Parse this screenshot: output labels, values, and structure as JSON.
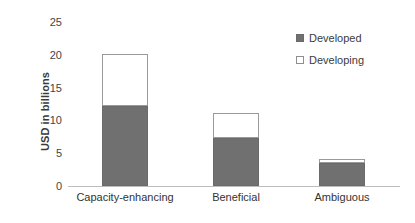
{
  "chart_data": {
    "type": "bar",
    "subtype": "stacked-vertical-bar",
    "title": "",
    "xlabel": "",
    "ylabel": "USD in billions",
    "categories": [
      "Capacity-enhancing",
      "Beneficial",
      "Ambiguous"
    ],
    "series": [
      {
        "name": "Developed",
        "values": [
          12.2,
          7.3,
          3.5
        ],
        "color": "#707070"
      },
      {
        "name": "Developing",
        "values": [
          8.0,
          3.8,
          0.6
        ],
        "color": "#ffffff"
      }
    ],
    "stacked_totals": [
      20.2,
      11.1,
      4.1
    ],
    "ylim": [
      0,
      25
    ],
    "yticks": [
      0,
      5,
      10,
      15,
      20,
      25
    ],
    "ytick_labels": [
      "0",
      "5",
      "10",
      "15",
      "20",
      "25"
    ],
    "grid": false,
    "legend_position": "top-right",
    "legend_entries": [
      "Developed",
      "Developing"
    ]
  },
  "axis": {
    "y_title": "USD in billions",
    "ticks": [
      {
        "value": 25,
        "label": "25"
      },
      {
        "value": 20,
        "label": "20"
      },
      {
        "value": 15,
        "label": "15"
      },
      {
        "value": 10,
        "label": "10"
      },
      {
        "value": 5,
        "label": "5"
      },
      {
        "value": 0,
        "label": "0"
      }
    ]
  },
  "bars": [
    {
      "category": "Capacity-enhancing",
      "developed": 12.2,
      "developing": 8.0,
      "total": 20.2
    },
    {
      "category": "Beneficial",
      "developed": 7.3,
      "developing": 3.8,
      "total": 11.1
    },
    {
      "category": "Ambiguous",
      "developed": 3.5,
      "developing": 0.6,
      "total": 4.1
    }
  ],
  "legend": {
    "items": [
      {
        "label": "Developed",
        "swatch": "filled-square-icon"
      },
      {
        "label": "Developing",
        "swatch": "hollow-square-icon"
      }
    ]
  },
  "colors": {
    "developed": "#707070",
    "developing": "#ffffff",
    "axis": "#bdbdbd",
    "text": "#333333",
    "background": "#ffffff"
  }
}
